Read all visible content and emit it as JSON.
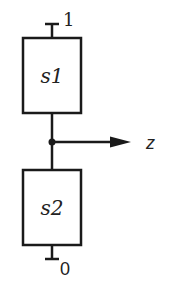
{
  "diagram": {
    "type": "circuit-block-diagram",
    "colors": {
      "stroke": "#1a1a1a",
      "background": "#ffffff",
      "text": "#222222"
    },
    "blocks": [
      {
        "id": "s1",
        "label": "s1",
        "position": "top"
      },
      {
        "id": "s2",
        "label": "s2",
        "position": "bottom"
      }
    ],
    "terminals": {
      "top": {
        "label": "1"
      },
      "bottom": {
        "label": "0"
      }
    },
    "output": {
      "label": "z",
      "direction": "right"
    }
  }
}
